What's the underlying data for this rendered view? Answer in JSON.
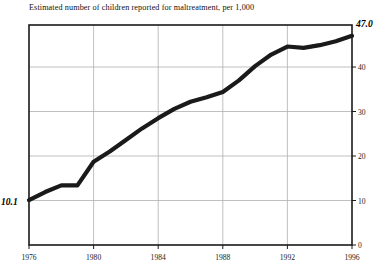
{
  "chart": {
    "title": "Estimated number of children reported for maltreatment, per 1,000",
    "start_label": "10.1",
    "end_label": "47.0"
  },
  "axes": {
    "x_tick_labels": [
      "1976",
      "1980",
      "1984",
      "1988",
      "1992",
      "1996"
    ],
    "y_tick_labels": [
      "0",
      "10",
      "20",
      "30",
      "40"
    ]
  },
  "colors": {
    "line": "#1a1a1a",
    "axis": "#1a1a1a",
    "grid": "#b0b0b0",
    "background": "#ffffff"
  },
  "chart_data": {
    "type": "line",
    "title": "Estimated number of children reported for maltreatment, per 1,000",
    "xlabel": "",
    "ylabel": "",
    "xlim": [
      1976,
      1996
    ],
    "ylim": [
      0,
      47
    ],
    "grid": true,
    "legend": "none",
    "x": [
      1976,
      1977,
      1978,
      1979,
      1980,
      1981,
      1982,
      1983,
      1984,
      1985,
      1986,
      1987,
      1988,
      1989,
      1990,
      1991,
      1992,
      1993,
      1994,
      1995,
      1996
    ],
    "values": [
      10.1,
      11.9,
      13.4,
      13.4,
      18.7,
      21.0,
      23.6,
      26.2,
      28.5,
      30.6,
      32.2,
      33.2,
      34.4,
      37.0,
      40.2,
      42.8,
      44.6,
      44.3,
      44.9,
      45.8,
      47.0
    ],
    "series": [
      {
        "name": "Children reported for maltreatment per 1,000",
        "values": [
          10.1,
          11.9,
          13.4,
          13.4,
          18.7,
          21.0,
          23.6,
          26.2,
          28.5,
          30.6,
          32.2,
          33.2,
          34.4,
          37.0,
          40.2,
          42.8,
          44.6,
          44.3,
          44.9,
          45.8,
          47.0
        ]
      }
    ],
    "annotations": [
      {
        "text": "10.1",
        "x": 1976,
        "y": 10.1,
        "position": "left"
      },
      {
        "text": "47.0",
        "x": 1996,
        "y": 47.0,
        "position": "right"
      }
    ],
    "x_ticks": [
      1976,
      1980,
      1984,
      1988,
      1992,
      1996
    ],
    "y_ticks": [
      0,
      10,
      20,
      30,
      40
    ]
  }
}
